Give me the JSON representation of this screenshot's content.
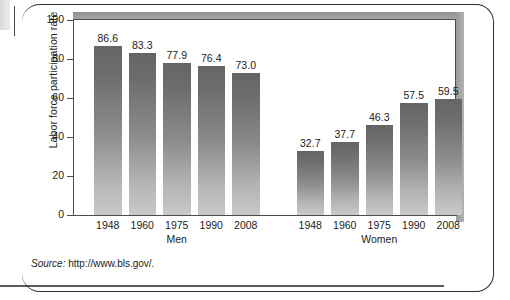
{
  "figure": {
    "source_prefix": "Source:",
    "source_url": "http://www.bls.gov/."
  },
  "chart_data": {
    "type": "bar",
    "title": "",
    "subtitle": "",
    "xlabel": "",
    "ylabel": "Labor force participation rate",
    "ylim": [
      0,
      100
    ],
    "yticks": [
      0,
      20,
      40,
      60,
      80,
      100
    ],
    "ytick_labels": [
      "0",
      "20",
      "40",
      "60",
      "80",
      "100"
    ],
    "grid": false,
    "legend": "none",
    "group_labels": [
      "Men",
      "Women"
    ],
    "categories": [
      "1948",
      "1960",
      "1975",
      "1990",
      "2008"
    ],
    "series": [
      {
        "name": "Men",
        "values": [
          86.6,
          83.3,
          77.9,
          76.4,
          73.0
        ]
      },
      {
        "name": "Women",
        "values": [
          32.7,
          37.7,
          46.3,
          57.5,
          59.5
        ]
      }
    ],
    "bars": [
      {
        "group": "Men",
        "category": "1948",
        "value": 86.6,
        "label": "86.6"
      },
      {
        "group": "Men",
        "category": "1960",
        "value": 83.3,
        "label": "83.3"
      },
      {
        "group": "Men",
        "category": "1975",
        "value": 77.9,
        "label": "77.9"
      },
      {
        "group": "Men",
        "category": "1990",
        "value": 76.4,
        "label": "76.4"
      },
      {
        "group": "Men",
        "category": "2008",
        "value": 73.0,
        "label": "73.0"
      },
      {
        "group": "Women",
        "category": "1948",
        "value": 32.7,
        "label": "32.7"
      },
      {
        "group": "Women",
        "category": "1960",
        "value": 37.7,
        "label": "37.7"
      },
      {
        "group": "Women",
        "category": "1975",
        "value": 46.3,
        "label": "46.3"
      },
      {
        "group": "Women",
        "category": "1990",
        "value": 57.5,
        "label": "57.5"
      },
      {
        "group": "Women",
        "category": "2008",
        "value": 59.5,
        "label": "59.5"
      }
    ],
    "colors": {
      "bar_top": "#656565",
      "bar_bottom": "#c9c9c9",
      "axis": "#4c4c4c",
      "text": "#1c1c1c",
      "shadow": "#9a9a9a",
      "background": "#ffffff"
    }
  }
}
